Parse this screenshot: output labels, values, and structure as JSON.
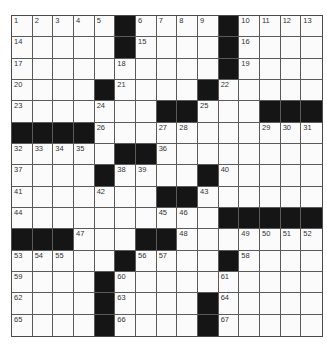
{
  "puzzle": {
    "rows": 15,
    "cols": 15,
    "grid": [
      ".....#....#....",
      ".....#....#....",
      "..........#....",
      "....#....#.....",
      ".......##...###",
      "####...........",
      ".....##........",
      "....#....#.....",
      ".......##......",
      "..........#####",
      "###...##.......",
      ".....#....#....",
      "....#..........",
      "....#....#.....",
      "....#....#....."
    ],
    "numbers": [
      [
        1,
        2,
        3,
        4,
        5,
        0,
        6,
        7,
        8,
        9,
        0,
        10,
        11,
        12,
        13
      ],
      [
        14,
        0,
        0,
        0,
        0,
        0,
        15,
        0,
        0,
        0,
        0,
        16,
        0,
        0,
        0
      ],
      [
        17,
        0,
        0,
        0,
        0,
        18,
        0,
        0,
        0,
        0,
        0,
        19,
        0,
        0,
        0
      ],
      [
        20,
        0,
        0,
        0,
        0,
        21,
        0,
        0,
        0,
        0,
        22,
        0,
        0,
        0,
        0
      ],
      [
        23,
        0,
        0,
        0,
        24,
        0,
        0,
        0,
        0,
        25,
        0,
        0,
        0,
        0,
        0
      ],
      [
        0,
        0,
        0,
        0,
        26,
        0,
        0,
        27,
        28,
        0,
        0,
        0,
        29,
        30,
        31
      ],
      [
        32,
        33,
        34,
        35,
        0,
        0,
        0,
        36,
        0,
        0,
        0,
        0,
        0,
        0,
        0
      ],
      [
        37,
        0,
        0,
        0,
        0,
        38,
        39,
        0,
        0,
        0,
        40,
        0,
        0,
        0,
        0
      ],
      [
        41,
        0,
        0,
        0,
        42,
        0,
        0,
        0,
        0,
        43,
        0,
        0,
        0,
        0,
        0
      ],
      [
        44,
        0,
        0,
        0,
        0,
        0,
        0,
        45,
        46,
        0,
        0,
        0,
        0,
        0,
        0
      ],
      [
        0,
        0,
        0,
        47,
        0,
        0,
        0,
        0,
        48,
        0,
        0,
        49,
        50,
        51,
        52
      ],
      [
        53,
        54,
        55,
        0,
        0,
        0,
        56,
        57,
        0,
        0,
        0,
        58,
        0,
        0,
        0
      ],
      [
        59,
        0,
        0,
        0,
        0,
        60,
        0,
        0,
        0,
        0,
        61,
        0,
        0,
        0,
        0
      ],
      [
        62,
        0,
        0,
        0,
        0,
        63,
        0,
        0,
        0,
        0,
        64,
        0,
        0,
        0,
        0
      ],
      [
        65,
        0,
        0,
        0,
        0,
        66,
        0,
        0,
        0,
        0,
        67,
        0,
        0,
        0,
        0
      ]
    ],
    "colors": {
      "block": "#151515",
      "cell": "#fbfbfb",
      "line": "#5a5a5a"
    }
  }
}
